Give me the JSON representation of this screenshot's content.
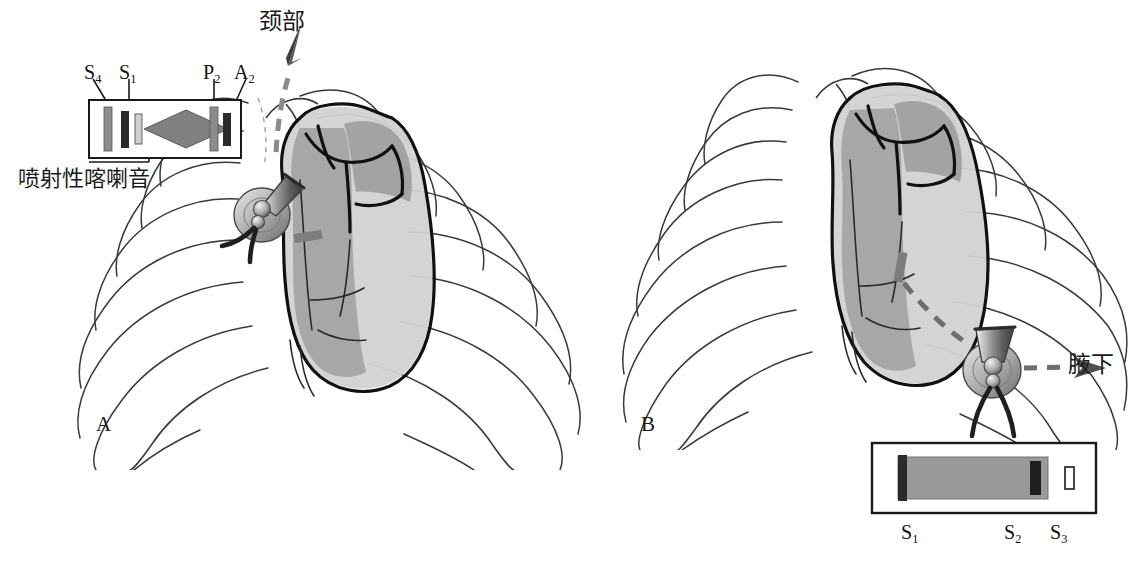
{
  "figure": {
    "type": "medical-illustration",
    "background_color": "#ffffff",
    "ink_color": "#1a1a1a"
  },
  "panels": [
    {
      "id": "A",
      "letter": "A",
      "phonocardiogram": {
        "box_label": "systolic ejection murmur tracing",
        "murmur_shape": "diamond",
        "sounds": [
          {
            "label": "S",
            "sub": "4",
            "name": "fourth-heart-sound",
            "color": "#8c8c8c"
          },
          {
            "label": "S",
            "sub": "1",
            "name": "first-heart-sound",
            "color": "#2b2b2b"
          },
          {
            "label": "P",
            "sub": "2",
            "name": "pulmonic-component",
            "color": "#8c8c8c"
          },
          {
            "label": "A",
            "sub": "2",
            "name": "aortic-component",
            "color": "#2b2b2b"
          }
        ],
        "annotation": "喷射性喀喇音",
        "annotation_meaning": "ejection click",
        "murmur_fill": "#808080"
      },
      "radiation": {
        "label": "颈部",
        "meaning": "neck",
        "arrow_direction": "up-right",
        "arrow_style": "dashed",
        "arrow_color": "#8a8a8a"
      },
      "stethoscope": {
        "name": "stethoscope-chestpiece",
        "position": "left-upper-sternal-border"
      }
    },
    {
      "id": "B",
      "letter": "B",
      "phonocardiogram": {
        "box_label": "holosystolic murmur tracing",
        "murmur_shape": "rectangular",
        "sounds": [
          {
            "label": "S",
            "sub": "1",
            "name": "first-heart-sound",
            "color": "#2b2b2b"
          },
          {
            "label": "S",
            "sub": "2",
            "name": "second-heart-sound",
            "color": "#2b2b2b"
          },
          {
            "label": "S",
            "sub": "3",
            "name": "third-heart-sound",
            "color": "#ffffff"
          }
        ],
        "murmur_fill": "#9a9a9a"
      },
      "radiation": {
        "label": "腋下",
        "meaning": "axilla",
        "arrow_direction": "right",
        "arrow_style": "dashed",
        "arrow_color": "#6e6e6e"
      },
      "stethoscope": {
        "name": "stethoscope-chestpiece",
        "position": "cardiac-apex"
      }
    }
  ],
  "colors": {
    "heart_shade_dark": "#9d9d9d",
    "heart_shade_light": "#c9c9c9",
    "rib_line": "#3a3a3a",
    "heart_outline": "#111111",
    "marker_bar": "#7d7d7d"
  }
}
